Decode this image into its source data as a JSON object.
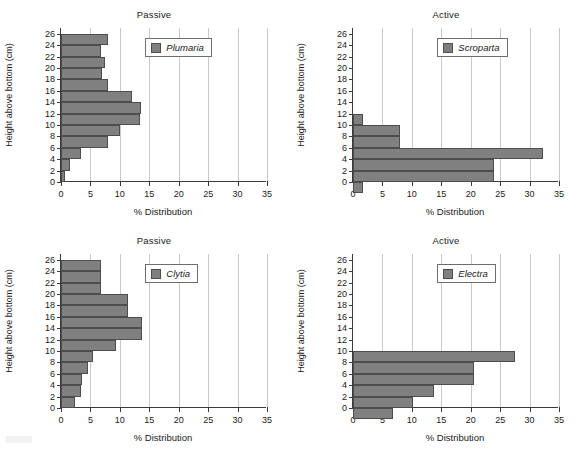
{
  "figure": {
    "xlabel": "% Distribution",
    "ylabel": "Height above bottom (cm)",
    "xticks": [
      "0",
      "5",
      "10",
      "15",
      "20",
      "25",
      "30",
      "35"
    ],
    "yticks": [
      "0",
      "2",
      "4",
      "6",
      "8",
      "10",
      "12",
      "14",
      "16",
      "18",
      "20",
      "22",
      "24",
      "26"
    ],
    "bar_color": "#808080",
    "bar_edge_color": "#4d4d4d",
    "gridline_color": "#c9c9c9",
    "axis_color": "#3a3a3a"
  },
  "chart_data": [
    {
      "type": "bar",
      "orientation": "horizontal",
      "panel": "top-left",
      "title": "Passive",
      "legend": "Plumaria",
      "legend_position": "upper right inside axes",
      "xlabel": "% Distribution",
      "ylabel": "Height above bottom (cm)",
      "xlim": [
        0,
        35
      ],
      "ylim": [
        0,
        27
      ],
      "grid": "vertical gridlines at x ticks",
      "categories": [
        2,
        4,
        6,
        8,
        10,
        12,
        14,
        16,
        18,
        20,
        22,
        24,
        26
      ],
      "values": [
        0.6,
        1.5,
        3.4,
        8.0,
        10.0,
        13.5,
        13.6,
        12.0,
        8.0,
        6.9,
        7.4,
        6.8,
        8.0
      ]
    },
    {
      "type": "bar",
      "orientation": "horizontal",
      "panel": "top-right",
      "title": "Active",
      "legend": "Scroparta",
      "legend_position": "upper right inside axes",
      "xlabel": "% Distribution",
      "ylabel": "Height above bottom (cm)",
      "xlim": [
        0,
        35
      ],
      "ylim": [
        0,
        27
      ],
      "grid": "vertical gridlines at x ticks",
      "categories": [
        0,
        2,
        4,
        6,
        8,
        10,
        12
      ],
      "values": [
        1.7,
        24.0,
        24.0,
        32.3,
        8.0,
        8.0,
        1.7
      ]
    },
    {
      "type": "bar",
      "orientation": "horizontal",
      "panel": "bottom-left",
      "title": "Passive",
      "legend": "Clytia",
      "legend_position": "upper right inside axes",
      "xlabel": "% Distribution",
      "ylabel": "Height above bottom (cm)",
      "xlim": [
        0,
        35
      ],
      "ylim": [
        0,
        27
      ],
      "grid": "vertical gridlines at x ticks",
      "categories": [
        2,
        4,
        6,
        8,
        10,
        12,
        14,
        16,
        18,
        20,
        22,
        24,
        26
      ],
      "values": [
        2.4,
        3.4,
        3.6,
        4.6,
        5.5,
        9.3,
        13.7,
        13.7,
        11.4,
        11.4,
        6.8,
        6.8,
        6.8
      ]
    },
    {
      "type": "bar",
      "orientation": "horizontal",
      "panel": "bottom-right",
      "title": "Active",
      "legend": "Electra",
      "legend_position": "upper right inside axes",
      "xlabel": "% Distribution",
      "ylabel": "Height above bottom (cm)",
      "xlim": [
        0,
        35
      ],
      "ylim": [
        0,
        27
      ],
      "grid": "vertical gridlines at x ticks",
      "categories": [
        0,
        2,
        4,
        6,
        8,
        10
      ],
      "values": [
        6.8,
        10.2,
        13.7,
        20.5,
        20.5,
        27.5
      ]
    }
  ]
}
